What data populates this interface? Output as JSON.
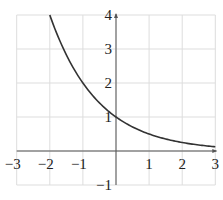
{
  "chart_data": {
    "type": "line",
    "title": "",
    "xlabel": "",
    "ylabel": "",
    "function": "y = (1/2)^x",
    "xlim": [
      -3,
      3
    ],
    "ylim": [
      -1,
      4
    ],
    "grid": true,
    "x_ticks": [
      "−3",
      "−2",
      "−1",
      "1",
      "2",
      "3"
    ],
    "y_ticks": [
      "4",
      "3",
      "2",
      "1",
      "−1"
    ],
    "series": [
      {
        "name": "y = (1/2)^x",
        "x": [
          -2,
          -1.5,
          -1,
          -0.5,
          0,
          0.5,
          1,
          1.5,
          2,
          2.5,
          3
        ],
        "y": [
          4,
          2.83,
          2,
          1.41,
          1,
          0.71,
          0.5,
          0.35,
          0.25,
          0.18,
          0.125
        ]
      }
    ],
    "colors": {
      "curve": "#333333",
      "grid": "#dddddd",
      "axis": "#555555"
    }
  }
}
